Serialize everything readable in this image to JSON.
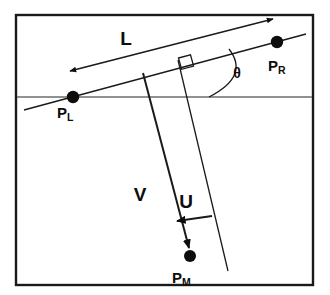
{
  "figure": {
    "colors": {
      "frame": "#1a1a1a",
      "horizon": "#6d6d6d",
      "ink": "#0d0d0d",
      "background": "#ffffff"
    },
    "points": [
      {
        "id": "PL",
        "base": "P",
        "subscript": "L",
        "label": "PL",
        "x": 73,
        "y": 97,
        "label_x": 57,
        "label_y": 118
      },
      {
        "id": "PR",
        "base": "P",
        "subscript": "R",
        "label": "PR",
        "x": 277,
        "y": 42,
        "label_x": 268,
        "label_y": 71
      },
      {
        "id": "PM",
        "base": "P",
        "subscript": "M",
        "label": "PM",
        "x": 190,
        "y": 256,
        "label_x": 172,
        "label_y": 283
      }
    ],
    "measures": [
      {
        "id": "L",
        "label": "L",
        "label_x": 126,
        "label_y": 45,
        "kind": "double-arrow-dimension"
      },
      {
        "id": "V",
        "label": "V",
        "label_x": 140,
        "label_y": 201,
        "kind": "vector-arrow"
      },
      {
        "id": "U",
        "label": "U",
        "label_x": 186,
        "label_y": 208,
        "kind": "vector-arrow"
      }
    ],
    "angle": {
      "id": "theta",
      "label": "θ",
      "label_x": 237,
      "label_y": 78,
      "vertex_x": 209,
      "vertex_y": 97
    },
    "annotations": {
      "right_angle": {
        "label": "right-angle",
        "x": 186,
        "y": 63
      },
      "horizon": {
        "label": "horizon-line",
        "y": 97
      }
    }
  }
}
